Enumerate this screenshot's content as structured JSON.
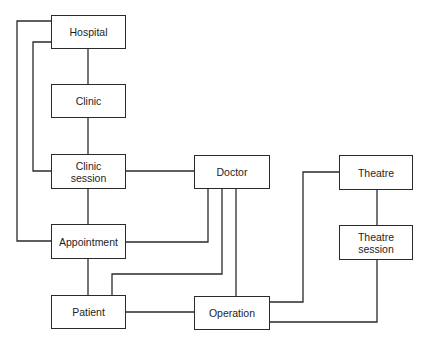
{
  "diagram": {
    "type": "entity-relationship",
    "stroke_color": "#2a2a2a",
    "entities": [
      {
        "id": "hospital",
        "label": "Hospital"
      },
      {
        "id": "clinic",
        "label": "Clinic"
      },
      {
        "id": "clinic_session",
        "label": "Clinic\nsession"
      },
      {
        "id": "doctor",
        "label": "Doctor"
      },
      {
        "id": "appointment",
        "label": "Appointment"
      },
      {
        "id": "patient",
        "label": "Patient"
      },
      {
        "id": "operation",
        "label": "Operation"
      },
      {
        "id": "theatre",
        "label": "Theatre"
      },
      {
        "id": "theatre_session",
        "label": "Theatre\nsession"
      }
    ],
    "relationships": [
      {
        "from": "Hospital",
        "to": "Clinic"
      },
      {
        "from": "Clinic",
        "to": "Clinic session"
      },
      {
        "from": "Hospital",
        "to": "Clinic session"
      },
      {
        "from": "Hospital",
        "to": "Appointment"
      },
      {
        "from": "Clinic session",
        "to": "Appointment"
      },
      {
        "from": "Clinic session",
        "to": "Doctor"
      },
      {
        "from": "Doctor",
        "to": "Appointment"
      },
      {
        "from": "Doctor",
        "to": "Patient"
      },
      {
        "from": "Doctor",
        "to": "Operation"
      },
      {
        "from": "Appointment",
        "to": "Patient"
      },
      {
        "from": "Patient",
        "to": "Operation"
      },
      {
        "from": "Operation",
        "to": "Theatre"
      },
      {
        "from": "Operation",
        "to": "Theatre session"
      },
      {
        "from": "Theatre",
        "to": "Theatre session"
      }
    ]
  }
}
